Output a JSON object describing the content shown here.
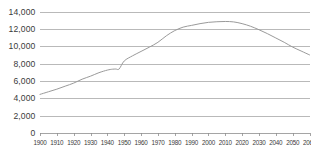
{
  "chart_data": {
    "type": "line",
    "title": "",
    "subtitle": "",
    "xlabel": "",
    "ylabel": "",
    "xlim": [
      1900,
      2060
    ],
    "ylim": [
      0,
      14000
    ],
    "grid": true,
    "legend": false,
    "legend_position": "none",
    "series_color": "#9a9a9a",
    "grid_color": "#a8a8a8",
    "axis_color": "#8f8f8f",
    "text_color": "#3a3a3a",
    "y_ticks": [
      0,
      2000,
      4000,
      6000,
      8000,
      10000,
      12000,
      14000
    ],
    "y_tick_labels": [
      "0",
      "2,000",
      "4,000",
      "6,000",
      "8,000",
      "10,000",
      "12,000",
      "14,000"
    ],
    "x_ticks": [
      1900,
      1910,
      1920,
      1930,
      1940,
      1950,
      1960,
      1970,
      1980,
      1990,
      2000,
      2010,
      2020,
      2030,
      2040,
      2050,
      2060
    ],
    "x_tick_labels": [
      "1900",
      "1910",
      "1920",
      "1930",
      "1940",
      "1950",
      "1960",
      "1970",
      "1980",
      "1990",
      "2000",
      "2010",
      "2020",
      "2030",
      "2040",
      "2050",
      "2060"
    ],
    "series": [
      {
        "name": "Population",
        "x": [
          1900,
          1905,
          1910,
          1915,
          1920,
          1925,
          1930,
          1935,
          1940,
          1943,
          1945,
          1947,
          1950,
          1955,
          1960,
          1965,
          1970,
          1975,
          1980,
          1985,
          1990,
          1995,
          2000,
          2005,
          2010,
          2015,
          2020,
          2025,
          2030,
          2035,
          2040,
          2045,
          2050,
          2055,
          2060
        ],
        "y": [
          4450,
          4750,
          5050,
          5400,
          5750,
          6200,
          6550,
          6950,
          7250,
          7350,
          7370,
          7380,
          8300,
          8900,
          9400,
          9900,
          10450,
          11200,
          11800,
          12200,
          12400,
          12600,
          12750,
          12820,
          12850,
          12800,
          12600,
          12300,
          11900,
          11450,
          10950,
          10450,
          9900,
          9450,
          9000
        ]
      }
    ]
  }
}
